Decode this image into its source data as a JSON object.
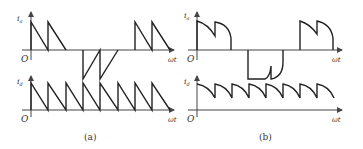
{
  "panels": [
    {
      "id": "a",
      "caption": "(a)",
      "top_plot": {
        "y_label": "i",
        "y_sub": "a",
        "origin": "O",
        "x_label": "ωt",
        "description": "phase current: two positive sawtooth teeth, two negative sawtooth teeth, two positive sawtooth teeth"
      },
      "bottom_plot": {
        "y_label": "i",
        "y_sub": "d",
        "origin": "O",
        "x_label": "ωt",
        "description": "DC current: continuous sawtooth, 8 teeth, dropping to zero each period"
      }
    },
    {
      "id": "b",
      "caption": "(b)",
      "top_plot": {
        "y_label": "i",
        "y_sub": "a",
        "origin": "O",
        "x_label": "ωt",
        "description": "phase current: two positive decaying arc humps, two negative arc humps, two positive arc humps"
      },
      "bottom_plot": {
        "y_label": "i",
        "y_sub": "d",
        "origin": "O",
        "x_label": "ωt",
        "description": "DC current: continuous ripple of 8 decaying arcs, never reaching zero"
      }
    }
  ]
}
